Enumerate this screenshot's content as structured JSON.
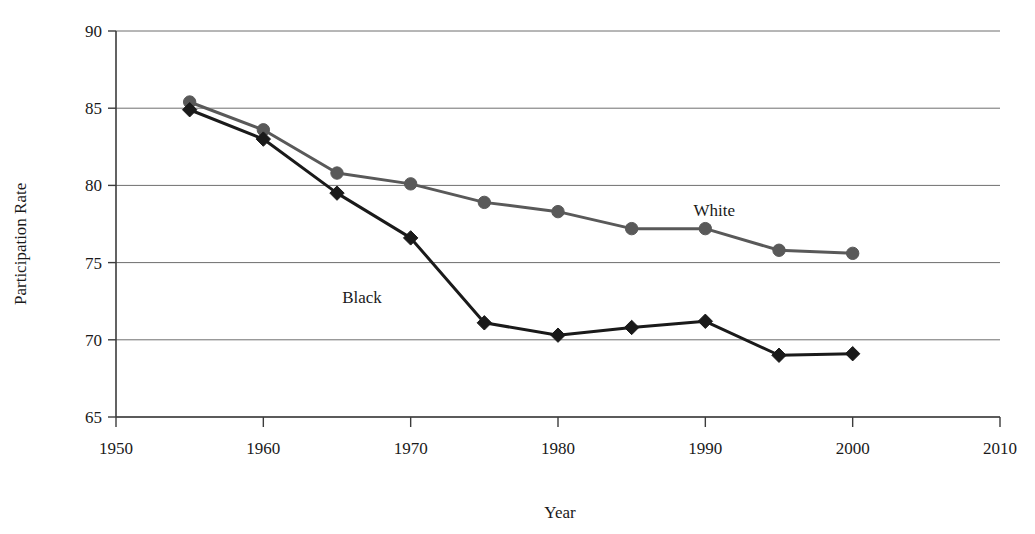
{
  "figure": {
    "top_fragment": "",
    "background": "#ffffff"
  },
  "chart_data": {
    "type": "line",
    "title": "",
    "xlabel": "Year",
    "ylabel": "Participation Rate",
    "xlim": [
      1950,
      2010
    ],
    "ylim": [
      65,
      90
    ],
    "xticks": [
      1950,
      1960,
      1970,
      1980,
      1990,
      2000,
      2010
    ],
    "yticks": [
      65,
      70,
      75,
      80,
      85,
      90
    ],
    "grid": "horizontal",
    "legend_position": "inline-annotations",
    "x": [
      1955,
      1960,
      1965,
      1970,
      1975,
      1980,
      1985,
      1990,
      1995,
      2000
    ],
    "series": [
      {
        "name": "White",
        "marker": "circle",
        "color": "#595959",
        "label_x": 1990.6,
        "label_y": 78.0,
        "values": [
          85.4,
          83.6,
          80.8,
          80.1,
          78.9,
          78.3,
          77.2,
          77.2,
          75.8,
          75.6
        ]
      },
      {
        "name": "Black",
        "marker": "diamond",
        "color": "#1a1a1a",
        "label_x": 1966.7,
        "label_y": 72.4,
        "values": [
          84.9,
          83.0,
          79.5,
          76.6,
          71.1,
          70.3,
          70.8,
          71.2,
          69.0,
          69.1
        ]
      }
    ],
    "colors": {
      "axis": "#3c3c3c",
      "grid": "#6e6e6e",
      "text": "#1a1a1a",
      "white_series": "#595959",
      "black_series": "#1a1a1a"
    }
  }
}
